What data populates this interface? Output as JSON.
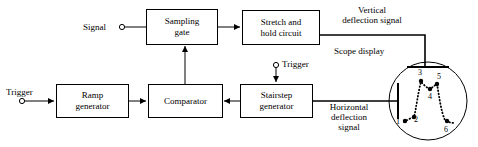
{
  "diagram": {
    "stroke_color": "#000000",
    "background_color": "#ffffff",
    "blocks": [
      {
        "id": "sampling-gate",
        "label": "Sampling\ngate",
        "line1": "Sampling",
        "line2": "gate",
        "x": 146,
        "y": 9,
        "w": 71,
        "h": 35
      },
      {
        "id": "stretch-hold",
        "label": "Stretch and\nhold circuit",
        "line1": "Stretch and",
        "line2": "hold circuit",
        "x": 242,
        "y": 10,
        "w": 77,
        "h": 34
      },
      {
        "id": "ramp-generator",
        "label": "Ramp\ngenerator",
        "line1": "Ramp",
        "line2": "generator",
        "x": 56,
        "y": 84,
        "w": 72,
        "h": 33
      },
      {
        "id": "comparator",
        "label": "Comparator",
        "line1": "Comparator",
        "line2": "",
        "x": 148,
        "y": 84,
        "w": 74,
        "h": 33
      },
      {
        "id": "stairstep-generator",
        "label": "Stairstep\ngenerator",
        "line1": "Stairstep",
        "line2": "generator",
        "x": 240,
        "y": 84,
        "w": 72,
        "h": 33
      }
    ],
    "terminals": [
      {
        "id": "signal-terminal",
        "label": "Signal",
        "label_side": "left",
        "cx": 122,
        "cy": 27
      },
      {
        "id": "trigger-terminal-left",
        "label": "Trigger",
        "label_side": "above",
        "cx": 22,
        "cy": 101
      },
      {
        "id": "trigger-terminal-stairstep",
        "label": "Trigger",
        "label_side": "right",
        "cx": 276,
        "cy": 65
      }
    ],
    "signal_labels": [
      {
        "id": "vertical-deflection-signal",
        "line1": "Vertical",
        "line2": "deflection signal",
        "x": 330,
        "y": 6
      },
      {
        "id": "horizontal-deflection-signal",
        "line1": "Horizontal",
        "line2": "deflection",
        "line3": "signal",
        "x": 318,
        "y": 103
      },
      {
        "id": "scope-display-label",
        "line1": "Scope display",
        "x": 334,
        "y": 48
      }
    ],
    "scope": {
      "id": "scope-display",
      "cx": 428,
      "cy": 101,
      "r": 39,
      "vertical_plate": {
        "x1": 407,
        "y1": 67,
        "x2": 449,
        "y2": 67
      },
      "horizontal_plate": {
        "x1": 398,
        "y1": 83,
        "x2": 398,
        "y2": 119
      },
      "waveform_points": [
        {
          "n": "1",
          "x": 405,
          "y": 120,
          "label_dx": -7,
          "label_dy": 2
        },
        {
          "n": "2",
          "x": 414,
          "y": 117,
          "label_dx": 1,
          "label_dy": 3
        },
        {
          "n": "3",
          "x": 421,
          "y": 81,
          "label_dx": -2,
          "label_dy": -9
        },
        {
          "n": "4",
          "x": 430,
          "y": 89,
          "label_dx": -1,
          "label_dy": 7
        },
        {
          "n": "5",
          "x": 437,
          "y": 84,
          "label_dx": 1,
          "label_dy": -7
        },
        {
          "n": "6",
          "x": 446,
          "y": 121,
          "label_dx": -1,
          "label_dy": 8
        }
      ]
    }
  }
}
